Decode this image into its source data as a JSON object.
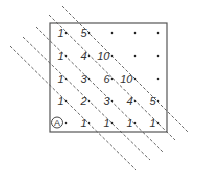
{
  "diagram": {
    "box": {
      "x": 50,
      "y": 23,
      "w": 117,
      "h": 109
    },
    "columns_x": [
      66,
      89,
      112,
      135,
      158
    ],
    "rows_y": [
      33,
      56,
      79,
      101,
      123
    ],
    "origin_label": "A",
    "grid": [
      [
        "1",
        "5",
        "",
        "",
        ""
      ],
      [
        "1",
        "4",
        "10",
        "",
        ""
      ],
      [
        "1",
        "3",
        "6",
        "10",
        ""
      ],
      [
        "1",
        "2",
        "3",
        "4",
        "5"
      ],
      [
        "A",
        "1",
        "1",
        "1",
        "1"
      ]
    ],
    "dashed_lines": [
      {
        "x1": 62,
        "y1": 6,
        "x2": 188,
        "y2": 132
      },
      {
        "x1": 49,
        "y1": 15,
        "x2": 175,
        "y2": 140
      },
      {
        "x1": 36,
        "y1": 27,
        "x2": 163,
        "y2": 152
      },
      {
        "x1": 23,
        "y1": 37,
        "x2": 150,
        "y2": 160
      },
      {
        "x1": 10,
        "y1": 46,
        "x2": 136,
        "y2": 170
      }
    ],
    "colors": {
      "line": "#555555",
      "dot": "#222222",
      "text": "#333333"
    }
  }
}
